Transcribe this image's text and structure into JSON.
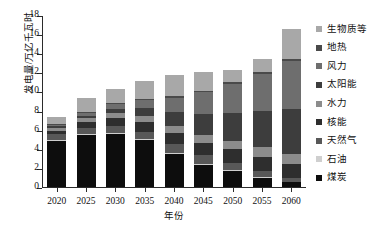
{
  "chart_data": {
    "type": "bar",
    "stacked": true,
    "title": "",
    "xlabel": "年份",
    "ylabel": "发电量/万亿千瓦时",
    "categories": [
      "2020",
      "2025",
      "2030",
      "2035",
      "2040",
      "2045",
      "2050",
      "2055",
      "2060"
    ],
    "ylim": [
      0,
      18
    ],
    "ytick_labels": [
      "0",
      "2",
      "4",
      "6",
      "8",
      "10",
      "12",
      "14",
      "16",
      "18"
    ],
    "ytick_values": [
      0,
      2,
      4,
      6,
      8,
      10,
      12,
      14,
      16,
      18
    ],
    "grid": false,
    "legend_position": "right",
    "legend_order_top_to_bottom": [
      "生物质等",
      "地热",
      "风力",
      "太阳能",
      "水力",
      "核能",
      "天然气",
      "石油",
      "煤炭"
    ],
    "series": [
      {
        "name": "煤炭",
        "color": "#0d0d0d",
        "values": [
          4.8,
          5.5,
          5.6,
          4.9,
          3.5,
          2.3,
          1.7,
          1.0,
          0.5
        ]
      },
      {
        "name": "石油",
        "color": "#cfcfcf",
        "values": [
          0.1,
          0.1,
          0.1,
          0.1,
          0.1,
          0.1,
          0.05,
          0.05,
          0.0
        ]
      },
      {
        "name": "天然气",
        "color": "#585858",
        "values": [
          0.6,
          0.6,
          0.7,
          0.8,
          0.9,
          0.9,
          0.8,
          0.6,
          0.4
        ]
      },
      {
        "name": "核能",
        "color": "#2e2e2e",
        "values": [
          0.4,
          0.6,
          0.8,
          1.0,
          1.2,
          1.3,
          1.4,
          1.5,
          1.5
        ]
      },
      {
        "name": "水力",
        "color": "#8c8c8c",
        "values": [
          0.3,
          0.4,
          0.5,
          0.6,
          0.7,
          0.8,
          0.9,
          1.0,
          1.1
        ]
      },
      {
        "name": "太阳能",
        "color": "#3d3d3d",
        "values": [
          0.15,
          0.25,
          0.45,
          0.85,
          1.45,
          2.2,
          2.9,
          3.8,
          4.7
        ]
      },
      {
        "name": "风力",
        "color": "#6e6e6e",
        "values": [
          0.15,
          0.3,
          0.5,
          0.9,
          1.5,
          2.3,
          3.0,
          3.9,
          5.0
        ]
      },
      {
        "name": "地热",
        "color": "#4a4a4a",
        "values": [
          0.05,
          0.05,
          0.1,
          0.1,
          0.15,
          0.15,
          0.2,
          0.2,
          0.2
        ]
      },
      {
        "name": "生物质等",
        "color": "#a8a8a8",
        "values": [
          0.75,
          1.5,
          1.55,
          1.85,
          2.2,
          2.0,
          1.25,
          1.35,
          3.1
        ]
      }
    ],
    "totals": [
      7.3,
      9.3,
      10.3,
      11.1,
      11.7,
      12.05,
      12.2,
      13.4,
      16.5
    ]
  },
  "legend": {
    "items": [
      {
        "label": "生物质等",
        "color": "#a8a8a8"
      },
      {
        "label": "地热",
        "color": "#4a4a4a"
      },
      {
        "label": "风力",
        "color": "#6e6e6e"
      },
      {
        "label": "太阳能",
        "color": "#3d3d3d"
      },
      {
        "label": "水力",
        "color": "#8c8c8c"
      },
      {
        "label": "核能",
        "color": "#2e2e2e"
      },
      {
        "label": "天然气",
        "color": "#585858"
      },
      {
        "label": "石油",
        "color": "#cfcfcf"
      },
      {
        "label": "煤炭",
        "color": "#0d0d0d"
      }
    ]
  },
  "axes": {
    "y_title": "发电量/万亿千瓦时",
    "x_title": "年份"
  }
}
